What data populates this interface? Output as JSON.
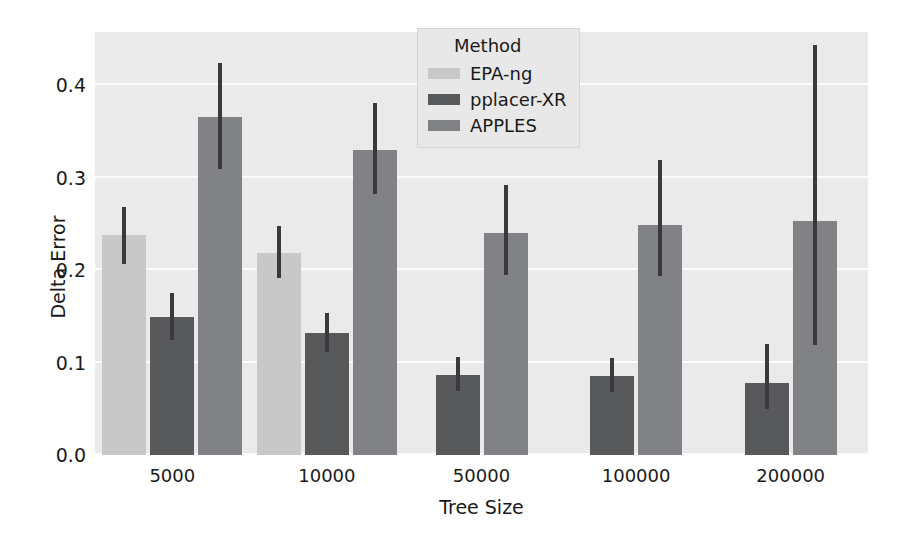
{
  "chart_data": {
    "type": "bar",
    "title": "",
    "xlabel": "Tree Size",
    "ylabel": "Delta Error",
    "categories": [
      "5000",
      "10000",
      "50000",
      "100000",
      "200000"
    ],
    "ylim": [
      0.0,
      0.4578
    ],
    "yticks": [
      "0.0",
      "0.1",
      "0.2",
      "0.3",
      "0.4"
    ],
    "ytick_values": [
      0.0,
      0.1,
      0.2,
      0.3,
      0.4
    ],
    "grid": true,
    "legend_title": "Method",
    "legend_position": "upper center",
    "errorbars": true,
    "series": [
      {
        "name": "EPA-ng",
        "color": "#c8c8c8",
        "values": [
          0.238,
          0.219,
          null,
          null,
          null
        ],
        "ci_low": [
          0.207,
          0.192,
          null,
          null,
          null
        ],
        "ci_high": [
          0.268,
          0.248,
          null,
          null,
          null
        ]
      },
      {
        "name": "pplacer-XR",
        "color": "#58595b",
        "values": [
          0.149,
          0.132,
          0.087,
          0.086,
          0.078
        ],
        "ci_low": [
          0.125,
          0.112,
          0.069,
          0.068,
          0.05
        ],
        "ci_high": [
          0.175,
          0.154,
          0.106,
          0.105,
          0.12
        ]
      },
      {
        "name": "APPLES",
        "color": "#808285",
        "values": [
          0.366,
          0.33,
          0.24,
          0.249,
          0.253
        ],
        "ci_low": [
          0.31,
          0.283,
          0.195,
          0.194,
          0.119
        ],
        "ci_high": [
          0.424,
          0.381,
          0.292,
          0.319,
          0.444
        ]
      }
    ]
  },
  "style": {
    "plot_background": "#eaeaea",
    "figure_background": "#ffffff",
    "gridline_color": "#fbfbfb",
    "text_color": "#1a1a1a",
    "errorbar_color": "#3a3a3c"
  }
}
